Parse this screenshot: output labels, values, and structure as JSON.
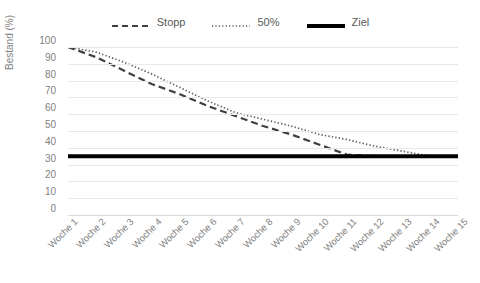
{
  "chart_data": {
    "type": "line",
    "title": "",
    "xlabel": "",
    "ylabel": "Bestand (%)",
    "ylim": [
      0,
      100
    ],
    "ytick_step": 10,
    "yticks": [
      100,
      90,
      80,
      70,
      60,
      50,
      40,
      30,
      20,
      10,
      0
    ],
    "grid": true,
    "legend_position": "top-center",
    "categories": [
      "Woche 1",
      "Woche 2",
      "Woche 3",
      "Woche 4",
      "Woche 5",
      "Woche 6",
      "Woche 7",
      "Woche 8",
      "Woche 9",
      "Woche 10",
      "Woche 11",
      "Woche 12",
      "Woche 13",
      "Woche 14",
      "Woche 15"
    ],
    "series": [
      {
        "name": "Stopp",
        "style": "dashed",
        "color": "#404040",
        "values": [
          100,
          94,
          86,
          78,
          72,
          65,
          59,
          53,
          48,
          42,
          36,
          35,
          35,
          35,
          35
        ]
      },
      {
        "name": "50%",
        "style": "dotted",
        "color": "#595959",
        "values": [
          100,
          97,
          91,
          84,
          76,
          68,
          61,
          57,
          53,
          48,
          45,
          41,
          38,
          35,
          35
        ]
      },
      {
        "name": "Ziel",
        "style": "solid",
        "color": "#000000",
        "values": [
          35,
          35,
          35,
          35,
          35,
          35,
          35,
          35,
          35,
          35,
          35,
          35,
          35,
          35,
          35
        ]
      }
    ]
  },
  "legend": {
    "items": [
      {
        "label": "Stopp",
        "icon": "dashed-line-icon"
      },
      {
        "label": "50%",
        "icon": "dotted-line-icon"
      },
      {
        "label": "Ziel",
        "icon": "solid-line-icon"
      }
    ]
  },
  "axes": {
    "y_title": "Bestand (%)"
  },
  "colors": {
    "grid": "#e8e8e8",
    "tick_text": "#7f7f7f",
    "legend_text": "#595959",
    "stopp": "#404040",
    "fifty": "#595959",
    "ziel": "#000000"
  }
}
